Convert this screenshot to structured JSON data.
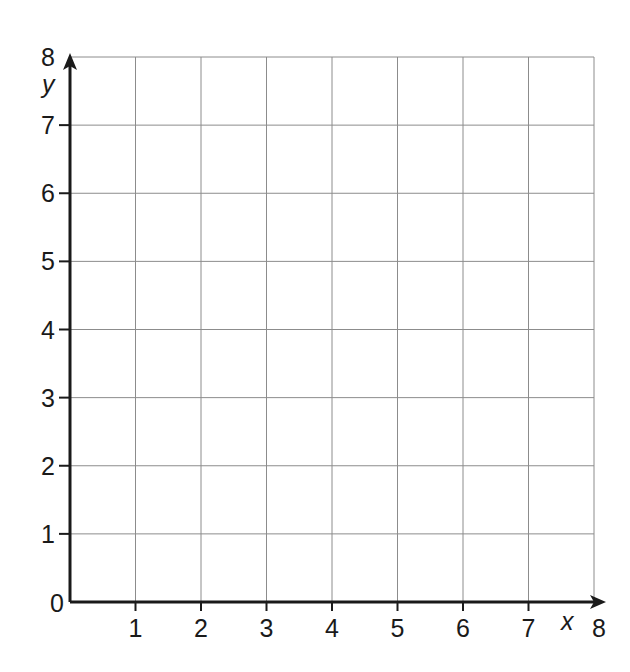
{
  "chart_data": {
    "type": "scatter",
    "title": "",
    "xlabel": "x",
    "ylabel": "y",
    "xlim": [
      0,
      8
    ],
    "ylim": [
      0,
      8
    ],
    "grid": true,
    "x_ticks": [
      1,
      2,
      3,
      4,
      5,
      6,
      7,
      8
    ],
    "y_ticks": [
      1,
      2,
      3,
      4,
      5,
      6,
      7,
      8
    ],
    "origin_label": "0",
    "series": []
  },
  "colors": {
    "grid": "#8c8c8c",
    "axis": "#1a1a1a",
    "background": "#ffffff"
  }
}
